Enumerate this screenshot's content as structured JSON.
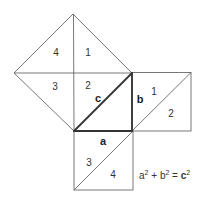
{
  "figure": {
    "stroke_color": "#555555",
    "thick_stroke_color": "#333333",
    "hypotenuse_square": {
      "pieces": [
        {
          "label": "4",
          "x": 56,
          "y": 56
        },
        {
          "label": "1",
          "x": 88,
          "y": 56
        },
        {
          "label": "3",
          "x": 55,
          "y": 90
        },
        {
          "label": "2",
          "x": 88,
          "y": 89
        }
      ]
    },
    "triangle_sides": {
      "a": {
        "label": "a",
        "x": 100,
        "y": 145
      },
      "b": {
        "label": "b",
        "x": 137,
        "y": 103
      },
      "c": {
        "label": "c",
        "x": 98,
        "y": 102
      }
    },
    "side_b_square": {
      "pieces": [
        {
          "label": "1",
          "x": 153,
          "y": 95
        },
        {
          "label": "2",
          "x": 169,
          "y": 117
        }
      ]
    },
    "side_a_square": {
      "pieces": [
        {
          "label": "3",
          "x": 86,
          "y": 166
        },
        {
          "label": "4",
          "x": 111,
          "y": 178
        }
      ]
    },
    "formula": {
      "a": "a",
      "a_exp": "2",
      "plus": " + ",
      "b": "b",
      "b_exp": "2",
      "equals": " = ",
      "c": "c",
      "c_exp": "2"
    }
  }
}
